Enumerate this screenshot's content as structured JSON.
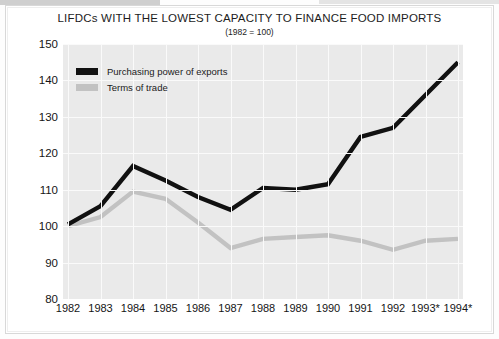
{
  "chart_data": {
    "type": "line",
    "title": "LIFDCs WITH THE LOWEST CAPACITY TO FINANCE FOOD IMPORTS",
    "subtitle": "(1982 = 100)",
    "xlabel": "",
    "ylabel": "",
    "categories": [
      "1982",
      "1983",
      "1984",
      "1985",
      "1986",
      "1987",
      "1988",
      "1989",
      "1990",
      "1991",
      "1992",
      "1993*",
      "1994*"
    ],
    "ylim": [
      80,
      150
    ],
    "yticks": [
      80,
      90,
      100,
      110,
      120,
      130,
      140,
      150
    ],
    "grid": true,
    "legend_position": "top-left",
    "series": [
      {
        "name": "Purchasing power of exports",
        "color": "#111111",
        "values": [
          100.5,
          105.5,
          116.5,
          112.5,
          108.0,
          104.5,
          110.5,
          110.0,
          111.5,
          124.5,
          127.0,
          136.0,
          145.0
        ]
      },
      {
        "name": "Terms of trade",
        "color": "#c2c2c2",
        "values": [
          100.0,
          102.5,
          109.5,
          107.5,
          101.0,
          94.0,
          96.5,
          97.0,
          97.5,
          96.0,
          93.5,
          96.0,
          96.5
        ]
      }
    ]
  }
}
